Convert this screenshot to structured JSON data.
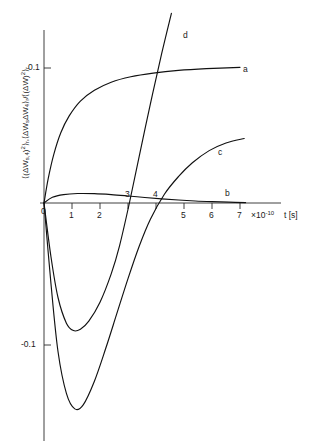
{
  "chart_data": {
    "type": "line",
    "title": "",
    "ylabel": "⟨(ΔW_{s,4})²⟩_r , ⟨ΔW_s ΔW_4⟩_r / ⟨(ΔW)²⟩_r",
    "ylabel_parts": {
      "open1": "⟨(ΔW",
      "sub1": "s,4",
      "sup1": ")²⟩",
      "sub2": "r",
      "mid": ",⟨ΔW",
      "sub3": "s",
      "mid2": "ΔW",
      "sub4": "4",
      "close1": "⟩",
      "sub5": "r",
      "div": "/⟨(ΔW)²⟩",
      "sub6": "r"
    },
    "xlabel": "t [s]",
    "x_unit_prefix": "×10",
    "x_unit_exponent": "-10",
    "xticks": [
      0,
      1,
      2,
      3,
      4,
      5,
      6,
      7
    ],
    "xticklabels": [
      "0",
      "1",
      "2",
      "3",
      "4",
      "5",
      "6",
      "7"
    ],
    "yticks": [
      0.1,
      0,
      -0.1
    ],
    "yticklabels": [
      "0.1",
      "0",
      "-0.1"
    ],
    "xlim": [
      0,
      7.6
    ],
    "ylim": [
      -0.185,
      0.145
    ],
    "grid": false,
    "legend": "inline-curve-labels",
    "series": [
      {
        "name": "a",
        "label": "a",
        "label_x": 7.05,
        "label_y": 0.1005,
        "description": "saturating rise from origin to about 0.1",
        "points": [
          [
            0.0,
            0.0
          ],
          [
            0.15,
            0.018
          ],
          [
            0.35,
            0.036
          ],
          [
            0.6,
            0.052
          ],
          [
            0.9,
            0.0645
          ],
          [
            1.3,
            0.0755
          ],
          [
            1.8,
            0.0835
          ],
          [
            2.4,
            0.0895
          ],
          [
            3.1,
            0.0935
          ],
          [
            3.9,
            0.0962
          ],
          [
            4.8,
            0.0982
          ],
          [
            5.8,
            0.0995
          ],
          [
            7.0,
            0.1005
          ]
        ]
      },
      {
        "name": "b",
        "label": "b",
        "label_x": 6.45,
        "label_y": 0.0105,
        "description": "very shallow positive bump near zero, returns to axis",
        "points": [
          [
            0.0,
            0.0
          ],
          [
            0.3,
            0.0042
          ],
          [
            0.7,
            0.0062
          ],
          [
            1.2,
            0.007
          ],
          [
            1.8,
            0.0069
          ],
          [
            2.4,
            0.0062
          ],
          [
            3.0,
            0.0052
          ],
          [
            3.6,
            0.0041
          ],
          [
            4.2,
            0.0031
          ],
          [
            4.8,
            0.0022
          ],
          [
            5.4,
            0.0015
          ],
          [
            6.0,
            0.001
          ],
          [
            6.6,
            0.0006
          ],
          [
            7.2,
            0.0003
          ]
        ]
      },
      {
        "name": "c",
        "label": "c",
        "label_x": 6.0,
        "label_y": 0.0475,
        "description": "deep negative dip then rise crossing zero near t=4.3",
        "points": [
          [
            0.0,
            0.0
          ],
          [
            0.25,
            -0.06
          ],
          [
            0.5,
            -0.11
          ],
          [
            0.8,
            -0.141
          ],
          [
            1.1,
            -0.1525
          ],
          [
            1.4,
            -0.1495
          ],
          [
            1.8,
            -0.132
          ],
          [
            2.2,
            -0.108
          ],
          [
            2.6,
            -0.082
          ],
          [
            3.0,
            -0.056
          ],
          [
            3.4,
            -0.032
          ],
          [
            3.8,
            -0.012
          ],
          [
            4.3,
            0.0065
          ],
          [
            4.8,
            0.0195
          ],
          [
            5.3,
            0.0298
          ],
          [
            5.9,
            0.0388
          ],
          [
            6.5,
            0.0445
          ],
          [
            7.15,
            0.0478
          ]
        ]
      },
      {
        "name": "d",
        "label": "d",
        "label_x": 5.05,
        "label_y": 0.1335,
        "description": "shallower negative dip then steep rise crossing zero near t=3.05 and exiting top",
        "points": [
          [
            0.0,
            0.0
          ],
          [
            0.25,
            -0.04
          ],
          [
            0.5,
            -0.07
          ],
          [
            0.8,
            -0.089
          ],
          [
            1.05,
            -0.0945
          ],
          [
            1.3,
            -0.0935
          ],
          [
            1.6,
            -0.0875
          ],
          [
            2.0,
            -0.0735
          ],
          [
            2.4,
            -0.0525
          ],
          [
            2.7,
            -0.0315
          ],
          [
            3.05,
            0.0
          ],
          [
            3.4,
            0.0345
          ],
          [
            3.8,
            0.0735
          ],
          [
            4.2,
            0.1105
          ],
          [
            4.55,
            0.1405
          ]
        ]
      }
    ]
  },
  "axes": {
    "x_tick_label_0": "0",
    "x_tick_label_1": "1",
    "x_tick_label_2": "2",
    "x_tick_label_3": "3",
    "x_tick_label_4": "4",
    "x_tick_label_5": "5",
    "x_tick_label_6": "6",
    "x_tick_label_7": "7",
    "y_tick_label_pos": "0.1",
    "y_tick_label_zero": "0",
    "y_tick_label_neg": "-0.1",
    "x_axis_unit": "×10",
    "x_axis_exponent": "-10",
    "x_axis_title": "t [s]"
  },
  "colors": {
    "curve": "#111111",
    "axis": "#2b2b2b",
    "background": "#ffffff",
    "text": "#1a1a1a"
  }
}
